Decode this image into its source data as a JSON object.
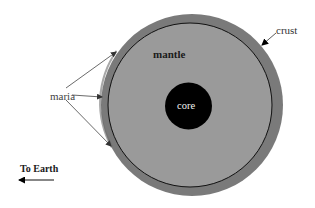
{
  "diagram": {
    "labels": {
      "mantle": "mantle",
      "core": "core",
      "crust": "crust",
      "maria": "maria",
      "direction": "To Earth"
    },
    "layers": [
      {
        "name": "crust",
        "color": "#7a7a7a"
      },
      {
        "name": "mantle",
        "color": "#9a9a9a"
      },
      {
        "name": "core",
        "color": "#000000"
      }
    ],
    "annotations": {
      "maria_arrow_count": 3,
      "crust_arrow_count": 1,
      "earth_arrow_direction": "left"
    }
  }
}
